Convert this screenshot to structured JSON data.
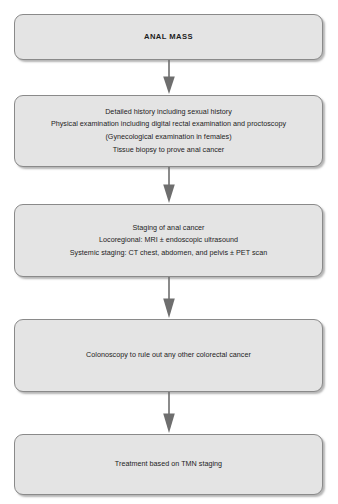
{
  "diagram": {
    "background_color": "#ffffff",
    "node_fill_color": "#e4e4e4",
    "node_border_color": "#8a8a8a",
    "arrow_color": "#6e6e6e",
    "text_color": "#1d1d1d",
    "nodes": [
      {
        "id": "anal-mass",
        "label": "ANAL MASS",
        "emphasis": "bold-uppercase"
      },
      {
        "id": "initial-evaluation",
        "label": "Detailed history including sexual history\nPhysical examination including digital rectal examination and proctoscopy\n(Gynecological examination in females)\nTissue biopsy to prove anal cancer"
      },
      {
        "id": "staging",
        "label": "Staging of anal cancer\nLocoregional: MRI ± endoscopic ultrasound\nSystemic staging: CT chest, abdomen, and pelvis ± PET scan"
      },
      {
        "id": "colonoscopy",
        "label": "Colonoscopy to rule out any other colorectal cancer"
      },
      {
        "id": "treatment",
        "label": "Treatment based on TMN staging"
      }
    ],
    "connectors": [
      {
        "id": "arrow-1",
        "from": "anal-mass",
        "to": "initial-evaluation",
        "direction": "down"
      },
      {
        "id": "arrow-2",
        "from": "initial-evaluation",
        "to": "staging",
        "direction": "down"
      },
      {
        "id": "arrow-3",
        "from": "staging",
        "to": "colonoscopy",
        "direction": "down"
      },
      {
        "id": "arrow-4",
        "from": "colonoscopy",
        "to": "treatment",
        "direction": "down"
      }
    ]
  }
}
